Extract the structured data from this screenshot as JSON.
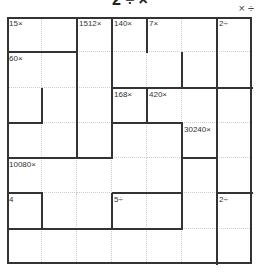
{
  "header": {
    "title": "2 ÷ ×",
    "operators": "× ÷"
  },
  "puzzle": {
    "size": 7,
    "cages": [
      {
        "clue": "15×",
        "r": 0,
        "c": 0
      },
      {
        "clue": "1512×",
        "r": 0,
        "c": 2
      },
      {
        "clue": "140×",
        "r": 0,
        "c": 3
      },
      {
        "clue": "7×",
        "r": 0,
        "c": 4
      },
      {
        "clue": "2÷",
        "r": 0,
        "c": 6
      },
      {
        "clue": "60×",
        "r": 1,
        "c": 0
      },
      {
        "clue": "168×",
        "r": 2,
        "c": 3
      },
      {
        "clue": "420×",
        "r": 2,
        "c": 4
      },
      {
        "clue": "30240×",
        "r": 3,
        "c": 5
      },
      {
        "clue": "10080×",
        "r": 4,
        "c": 0
      },
      {
        "clue": "4",
        "r": 5,
        "c": 0
      },
      {
        "clue": "5÷",
        "r": 5,
        "c": 3
      },
      {
        "clue": "2÷",
        "r": 5,
        "c": 6
      }
    ],
    "hwalls": [
      [
        1,
        0,
        2
      ],
      [
        2,
        4,
        5
      ],
      [
        2,
        3,
        7
      ],
      [
        3,
        0,
        1
      ],
      [
        3,
        3,
        5
      ],
      [
        4,
        0,
        3
      ],
      [
        4,
        5,
        6
      ],
      [
        5,
        0,
        1
      ],
      [
        5,
        3,
        5
      ],
      [
        5,
        6,
        7
      ],
      [
        6,
        0,
        5
      ]
    ],
    "vwalls": [
      [
        2,
        0,
        4
      ],
      [
        3,
        0,
        4
      ],
      [
        4,
        0,
        1
      ],
      [
        6,
        0,
        5
      ],
      [
        1,
        2,
        3
      ],
      [
        5,
        1,
        2
      ],
      [
        4,
        2,
        3
      ],
      [
        5,
        3,
        6
      ],
      [
        1,
        5,
        6
      ],
      [
        3,
        5,
        6
      ],
      [
        6,
        5,
        7
      ]
    ]
  }
}
